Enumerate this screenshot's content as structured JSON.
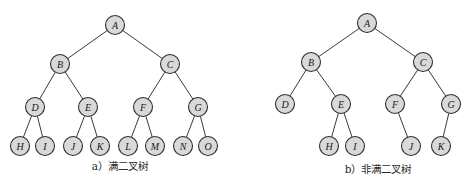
{
  "colors": {
    "node_fill": "#d9d9d9",
    "node_stroke": "#2e2e2e",
    "edge": "#3a3a3a",
    "text": "#1a1a1a"
  },
  "diagrams": [
    {
      "caption": "a）满二叉树",
      "caption_pos": [
        120,
        170
      ],
      "node_radius": 9.5,
      "nodes": [
        {
          "id": "A",
          "x": 115,
          "y": 25
        },
        {
          "id": "B",
          "x": 60,
          "y": 64
        },
        {
          "id": "C",
          "x": 170,
          "y": 64
        },
        {
          "id": "D",
          "x": 35,
          "y": 107
        },
        {
          "id": "E",
          "x": 88,
          "y": 107
        },
        {
          "id": "F",
          "x": 143,
          "y": 107
        },
        {
          "id": "G",
          "x": 198,
          "y": 107
        },
        {
          "id": "H",
          "x": 20,
          "y": 146
        },
        {
          "id": "I",
          "x": 45,
          "y": 146
        },
        {
          "id": "J",
          "x": 73,
          "y": 146
        },
        {
          "id": "K",
          "x": 100,
          "y": 146
        },
        {
          "id": "L",
          "x": 128,
          "y": 146
        },
        {
          "id": "M",
          "x": 155,
          "y": 146
        },
        {
          "id": "N",
          "x": 183,
          "y": 146
        },
        {
          "id": "O",
          "x": 208,
          "y": 146
        }
      ],
      "edges": [
        [
          "A",
          "B"
        ],
        [
          "A",
          "C"
        ],
        [
          "B",
          "D"
        ],
        [
          "B",
          "E"
        ],
        [
          "C",
          "F"
        ],
        [
          "C",
          "G"
        ],
        [
          "D",
          "H"
        ],
        [
          "D",
          "I"
        ],
        [
          "E",
          "J"
        ],
        [
          "E",
          "K"
        ],
        [
          "F",
          "L"
        ],
        [
          "F",
          "M"
        ],
        [
          "G",
          "N"
        ],
        [
          "G",
          "O"
        ]
      ]
    },
    {
      "caption": "b）非满二叉树",
      "caption_pos": [
        378,
        173
      ],
      "node_radius": 9.5,
      "nodes": [
        {
          "id": "A",
          "x": 367,
          "y": 23
        },
        {
          "id": "B",
          "x": 311,
          "y": 62
        },
        {
          "id": "C",
          "x": 423,
          "y": 62
        },
        {
          "id": "D",
          "x": 285,
          "y": 104
        },
        {
          "id": "E",
          "x": 341,
          "y": 104
        },
        {
          "id": "F",
          "x": 395,
          "y": 104
        },
        {
          "id": "G",
          "x": 451,
          "y": 104
        },
        {
          "id": "H",
          "x": 329,
          "y": 146
        },
        {
          "id": "I",
          "x": 355,
          "y": 146
        },
        {
          "id": "J",
          "x": 411,
          "y": 146
        },
        {
          "id": "K",
          "x": 441,
          "y": 146
        }
      ],
      "edges": [
        [
          "A",
          "B"
        ],
        [
          "A",
          "C"
        ],
        [
          "B",
          "D"
        ],
        [
          "B",
          "E"
        ],
        [
          "C",
          "F"
        ],
        [
          "C",
          "G"
        ],
        [
          "E",
          "H"
        ],
        [
          "E",
          "I"
        ],
        [
          "F",
          "J"
        ],
        [
          "G",
          "K"
        ]
      ]
    }
  ]
}
